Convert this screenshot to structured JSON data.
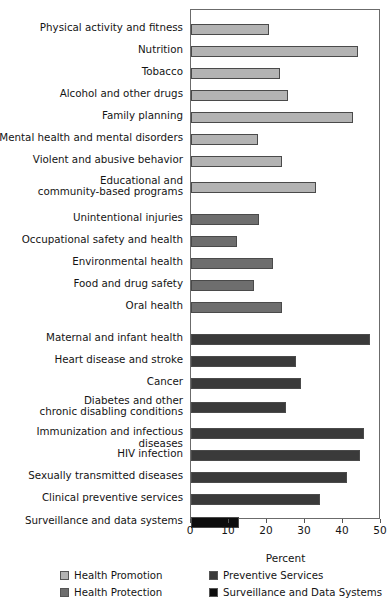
{
  "chart_data": {
    "type": "bar",
    "orientation": "horizontal",
    "title": "",
    "xlabel": "Percent",
    "ylabel": "",
    "xlim": [
      0,
      50
    ],
    "xticks": [
      0,
      10,
      20,
      30,
      40,
      50
    ],
    "xtick_labels": [
      "0",
      "10",
      "20",
      "30",
      "40",
      "50"
    ],
    "grid": false,
    "legend_position": "bottom",
    "categories": [
      "Physical activity and fitness",
      "Nutrition",
      "Tobacco",
      "Alcohol and other drugs",
      "Family planning",
      "Mental health and mental disorders",
      "Violent and abusive behavior",
      "Educational and\ncommunity-based programs",
      "Unintentional injuries",
      "Occupational safety and health",
      "Environmental health",
      "Food and drug safety",
      "Oral health",
      "Maternal and infant health",
      "Heart disease and stroke",
      "Cancer",
      "Diabetes and other\nchronic disabling conditions",
      "Immunization and infectious diseases",
      "HIV infection",
      "Sexually transmitted diseases",
      "Clinical preventive services",
      "Surveillance and data systems"
    ],
    "values": [
      20.5,
      44.0,
      23.5,
      25.5,
      42.5,
      17.5,
      24.0,
      33.0,
      18.0,
      12.0,
      21.5,
      16.5,
      24.0,
      47.0,
      27.5,
      29.0,
      25.0,
      45.5,
      44.5,
      41.0,
      34.0,
      12.5
    ],
    "series": [
      {
        "name": "Health Promotion",
        "color": "#b3b3b3",
        "members": [
          "Physical activity and fitness",
          "Nutrition",
          "Tobacco",
          "Alcohol and other drugs",
          "Family planning",
          "Mental health and mental disorders",
          "Violent and abusive behavior",
          "Educational and community-based programs"
        ]
      },
      {
        "name": "Health Protection",
        "color": "#6e6e6e",
        "members": [
          "Unintentional injuries",
          "Occupational safety and health",
          "Environmental health",
          "Food and drug safety",
          "Oral health"
        ]
      },
      {
        "name": "Preventive Services",
        "color": "#3a3a3a",
        "members": [
          "Maternal and infant health",
          "Heart disease and stroke",
          "Cancer",
          "Diabetes and other chronic disabling conditions",
          "Immunization and infectious diseases",
          "HIV infection",
          "Sexually transmitted diseases",
          "Clinical preventive services"
        ]
      },
      {
        "name": "Surveillance and Data Systems",
        "color": "#0d0d0d",
        "members": [
          "Surveillance and data systems"
        ]
      }
    ],
    "bars": [
      {
        "label": "Physical activity and fitness",
        "value": 20.5,
        "group": "Health Promotion"
      },
      {
        "label": "Nutrition",
        "value": 44.0,
        "group": "Health Promotion"
      },
      {
        "label": "Tobacco",
        "value": 23.5,
        "group": "Health Promotion"
      },
      {
        "label": "Alcohol and other drugs",
        "value": 25.5,
        "group": "Health Promotion"
      },
      {
        "label": "Family planning",
        "value": 42.5,
        "group": "Health Promotion"
      },
      {
        "label": "Mental health and mental disorders",
        "value": 17.5,
        "group": "Health Promotion"
      },
      {
        "label": "Violent and abusive behavior",
        "value": 24.0,
        "group": "Health Promotion"
      },
      {
        "label": "Educational and\ncommunity-based programs",
        "value": 33.0,
        "group": "Health Promotion"
      },
      {
        "label": "Unintentional injuries",
        "value": 18.0,
        "group": "Health Protection"
      },
      {
        "label": "Occupational safety and health",
        "value": 12.0,
        "group": "Health Protection"
      },
      {
        "label": "Environmental health",
        "value": 21.5,
        "group": "Health Protection"
      },
      {
        "label": "Food and drug safety",
        "value": 16.5,
        "group": "Health Protection"
      },
      {
        "label": "Oral health",
        "value": 24.0,
        "group": "Health Protection"
      },
      {
        "label": "Maternal and infant health",
        "value": 47.0,
        "group": "Preventive Services"
      },
      {
        "label": "Heart disease and stroke",
        "value": 27.5,
        "group": "Preventive Services"
      },
      {
        "label": "Cancer",
        "value": 29.0,
        "group": "Preventive Services"
      },
      {
        "label": "Diabetes and other\nchronic disabling conditions",
        "value": 25.0,
        "group": "Preventive Services"
      },
      {
        "label": "Immunization and infectious diseases",
        "value": 45.5,
        "group": "Preventive Services"
      },
      {
        "label": "HIV infection",
        "value": 44.5,
        "group": "Preventive Services"
      },
      {
        "label": "Sexually transmitted diseases",
        "value": 41.0,
        "group": "Preventive Services"
      },
      {
        "label": "Clinical preventive services",
        "value": 34.0,
        "group": "Preventive Services"
      },
      {
        "label": "Surveillance and data systems",
        "value": 12.5,
        "group": "Surveillance and Data Systems"
      }
    ]
  },
  "legend": {
    "items": [
      {
        "label": "Health Promotion",
        "color": "#b3b3b3"
      },
      {
        "label": "Health Protection",
        "color": "#6e6e6e"
      },
      {
        "label": "Preventive Services",
        "color": "#3a3a3a"
      },
      {
        "label": "Surveillance and Data Systems",
        "color": "#0d0d0d"
      }
    ]
  },
  "axis": {
    "title": "Percent",
    "ticks": [
      "0",
      "10",
      "20",
      "30",
      "40",
      "50"
    ]
  }
}
